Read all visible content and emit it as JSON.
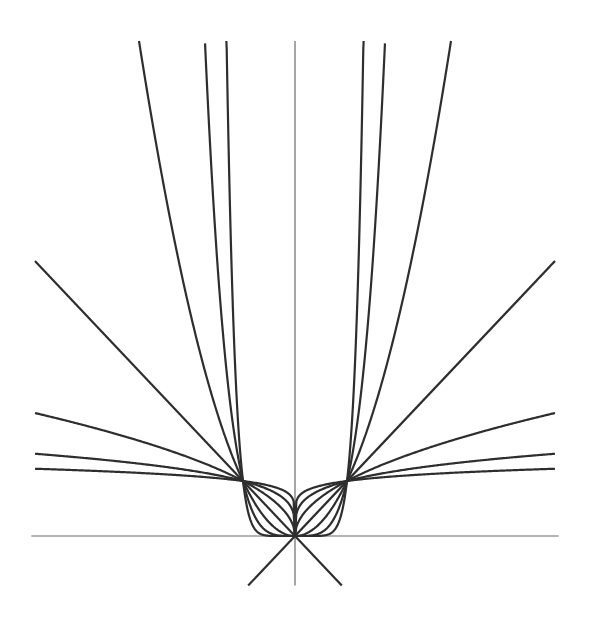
{
  "chart_data": {
    "type": "line",
    "title": "",
    "xlabel": "",
    "ylabel": "",
    "xlim": [
      -5,
      5
    ],
    "ylim": [
      -0.9,
      9
    ],
    "grid": false,
    "legend": null,
    "axes": {
      "x_axis": {
        "from": -5.07,
        "to": 5.07,
        "y": 0
      },
      "y_axis": {
        "x": 0,
        "from": -0.9,
        "to": 9.0
      }
    },
    "series": [
      {
        "name": "y = |x|^(1/8)",
        "exponent": 0.125,
        "x_range": [
          -5,
          5
        ]
      },
      {
        "name": "y = |x|^(1/4)",
        "exponent": 0.25,
        "x_range": [
          -5,
          5
        ]
      },
      {
        "name": "y = |x|^(1/2)",
        "exponent": 0.5,
        "x_range": [
          -5,
          5
        ]
      },
      {
        "name": "y = |x|",
        "exponent": 1,
        "x_range": [
          -5,
          5
        ]
      },
      {
        "name": "y = |x|^2",
        "exponent": 2,
        "x_range": [
          -3,
          3
        ]
      },
      {
        "name": "y = |x|^4",
        "exponent": 4,
        "x_range": [
          -1.73,
          1.73
        ]
      },
      {
        "name": "y = |x|^8",
        "exponent": 8,
        "x_range": [
          -1.32,
          1.32
        ]
      }
    ],
    "lines": [
      {
        "name": "y = x (below origin)",
        "from": [
          -0.9,
          -0.9
        ],
        "to": [
          0,
          0
        ]
      },
      {
        "name": "y = -x (below origin)",
        "from": [
          0.9,
          -0.9
        ],
        "to": [
          0,
          0
        ]
      }
    ],
    "key_points": [
      {
        "x": -1,
        "y": 1
      },
      {
        "x": 0,
        "y": 0
      },
      {
        "x": 1,
        "y": 1
      }
    ],
    "pixel_mapping": {
      "origin_px": [
        295,
        536
      ],
      "unit_x_px": 52,
      "unit_y_px": 55
    }
  }
}
